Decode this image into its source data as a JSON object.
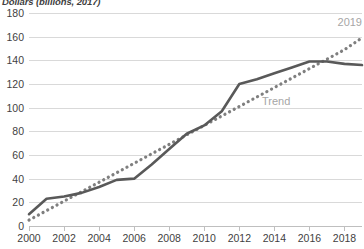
{
  "chart_data": {
    "type": "line",
    "title": "Dollars (billions, 2017)",
    "xlabel": "",
    "ylabel": "",
    "ylim": [
      0,
      180
    ],
    "ytick_step": 20,
    "yticks": [
      180,
      160,
      140,
      120,
      100,
      80,
      60,
      40,
      20,
      0
    ],
    "xlim": [
      2000,
      2019
    ],
    "xticks": [
      2000,
      2002,
      2004,
      2006,
      2008,
      2010,
      2012,
      2014,
      2016,
      2018
    ],
    "x": [
      2000,
      2001,
      2002,
      2003,
      2004,
      2005,
      2006,
      2007,
      2008,
      2009,
      2010,
      2011,
      2012,
      2013,
      2014,
      2015,
      2016,
      2017,
      2018,
      2019
    ],
    "grid": "horizontal",
    "legend": "none",
    "series": [
      {
        "name": "Actual",
        "style": "solid",
        "color": "#595959",
        "values": [
          10,
          23,
          25,
          28,
          33,
          39,
          40,
          52,
          65,
          78,
          85,
          97,
          120,
          124,
          129,
          134,
          139,
          139,
          137,
          136
        ]
      },
      {
        "name": "Trend",
        "style": "dotted",
        "color": "#7f7f7f",
        "values": [
          5,
          13,
          21,
          29,
          37,
          45,
          53,
          61,
          69,
          77,
          85,
          93,
          101,
          109,
          117,
          125,
          133,
          141,
          149,
          159
        ]
      }
    ],
    "annotations": [
      {
        "text": "2019",
        "color": "#a6a6a6"
      },
      {
        "text": "Trend",
        "color": "#a6a6a6"
      }
    ]
  },
  "axes": {
    "y_tick_labels": [
      "180",
      "160",
      "140",
      "120",
      "100",
      "80",
      "60",
      "40",
      "20",
      "0"
    ],
    "x_tick_labels": [
      "2000",
      "2002",
      "2004",
      "2006",
      "2008",
      "2010",
      "2012",
      "2014",
      "2016",
      "2018"
    ]
  },
  "annotations": {
    "year_label": "2019",
    "trend_label": "Trend"
  }
}
